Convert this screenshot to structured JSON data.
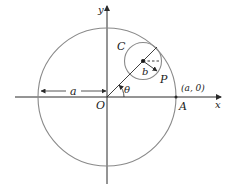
{
  "diagram": {
    "type": "geometry",
    "colors": {
      "circle": "#8a8a8a",
      "axis": "#2a2a2a",
      "text": "#1a1a1a"
    },
    "labels": {
      "y_axis": "y",
      "x_axis": "x",
      "origin": "O",
      "point_a": "A",
      "point_a_coords": "(a, 0)",
      "radius_big": "a",
      "radius_small": "b",
      "small_circle": "C",
      "point_p": "P",
      "angle": "θ"
    }
  }
}
